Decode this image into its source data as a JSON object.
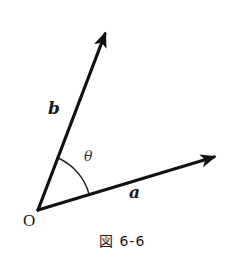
{
  "figure": {
    "caption": "図 6-6",
    "origin_label": "O",
    "vectors": [
      {
        "name": "a",
        "label": "a",
        "tail": [
          38,
          210
        ],
        "head": [
          221,
          155
        ]
      },
      {
        "name": "b",
        "label": "b",
        "tail": [
          38,
          210
        ],
        "head": [
          108,
          27
        ]
      }
    ],
    "angle": {
      "label": "θ",
      "between": [
        "a",
        "b"
      ]
    },
    "colors": {
      "stroke": "#111111",
      "background": "#ffffff"
    }
  }
}
